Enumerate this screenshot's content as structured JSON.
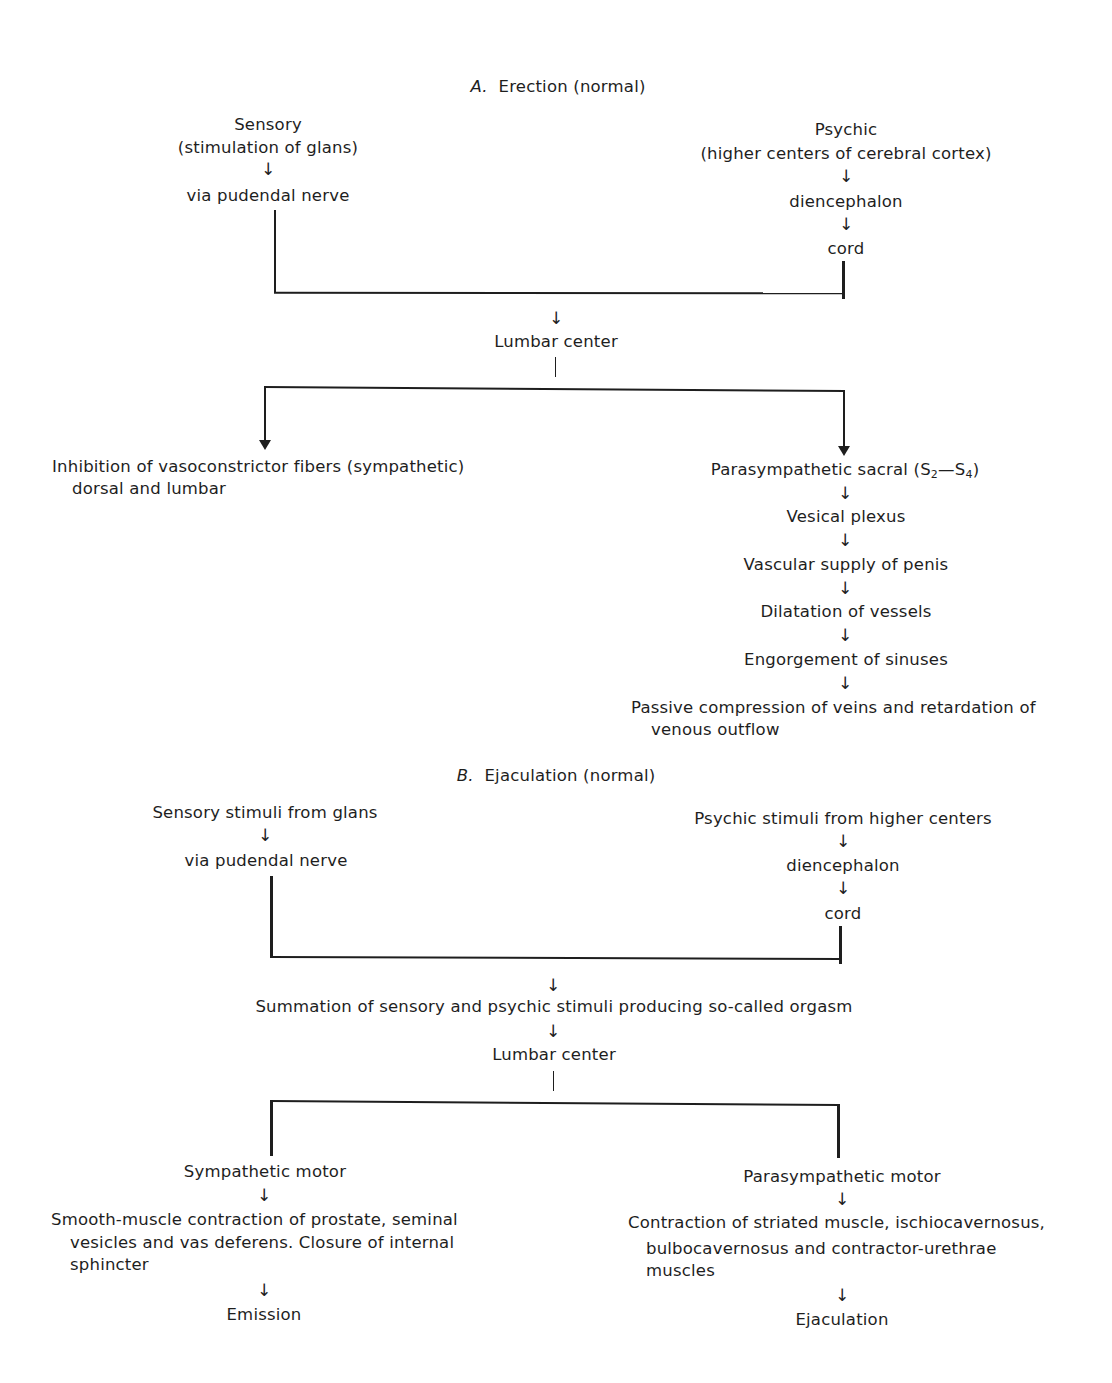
{
  "section_a": {
    "letter": "A.",
    "title": "Erection (normal)",
    "sensory": {
      "line1": "Sensory",
      "line2": "(stimulation of glans)",
      "step": "via pudendal nerve"
    },
    "psychic": {
      "line1": "Psychic",
      "line2": "(higher centers of cerebral cortex)",
      "step1": "diencephalon",
      "step2": "cord"
    },
    "center": "Lumbar center",
    "left_branch": {
      "line1": "Inhibition of vasoconstrictor fibers (sympathetic)",
      "line2": "dorsal and lumbar"
    },
    "right_branch": {
      "head_prefix": "Parasympathetic sacral (S",
      "sub1": "2",
      "dash": "—S",
      "sub2": "4",
      "close": ")",
      "steps": [
        "Vesical plexus",
        "Vascular supply of penis",
        "Dilatation of vessels",
        "Engorgement of sinuses"
      ],
      "final_line1": "Passive compression of veins and retardation of",
      "final_line2": "venous outflow"
    }
  },
  "section_b": {
    "letter": "B.",
    "title": "Ejaculation (normal)",
    "sensory": {
      "line1": "Sensory stimuli from glans",
      "step": "via pudendal nerve"
    },
    "psychic": {
      "line1": "Psychic stimuli from higher centers",
      "step1": "diencephalon",
      "step2": "cord"
    },
    "summation": "Summation of sensory and psychic stimuli producing so-called orgasm",
    "center": "Lumbar center",
    "left_branch": {
      "head": "Sympathetic motor",
      "line1": "Smooth-muscle contraction of prostate, seminal",
      "line2": "vesicles and vas deferens. Closure of internal",
      "line3": "sphincter",
      "result": "Emission"
    },
    "right_branch": {
      "head": "Parasympathetic motor",
      "line1": "Contraction of striated muscle, ischiocavernosus,",
      "line2": "bulbocavernosus and contractor-urethrae",
      "line3": "muscles",
      "result": "Ejaculation"
    }
  },
  "glyphs": {
    "down_arrow": "↓"
  },
  "colors": {
    "ink": "#1e1e1e",
    "background": "#ffffff"
  }
}
